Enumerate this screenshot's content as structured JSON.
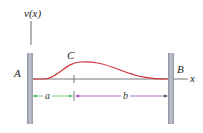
{
  "diagram": {
    "labels": {
      "vertical_axis": "v(x)",
      "horizontal_axis": "x",
      "left_support": "A",
      "right_support": "B",
      "peak_point": "C",
      "dim_a": "a",
      "dim_b": "b"
    },
    "colors": {
      "curve": "#d0343a",
      "dim_a": "#4cbb5c",
      "dim_b": "#9a4fb5",
      "wall": "#a7abb8",
      "axis": "#555555"
    }
  }
}
